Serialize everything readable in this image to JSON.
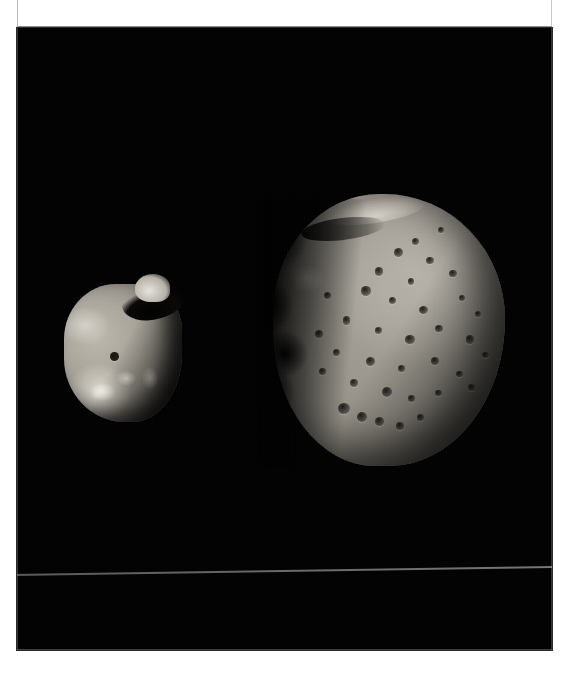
{
  "page": {
    "background_color": "#ffffff",
    "kind": "scanned-photo-page"
  },
  "header": {
    "clipped_caption": "PHOBOS AND DEIMOS, THE TWO MOONS OF MARS",
    "band_color": "#ffffff",
    "border_color": "#8d8d8d"
  },
  "plate": {
    "name": "photographic-plate",
    "background_color": "#010101",
    "x": 17,
    "y": 28,
    "width": 535,
    "height": 622,
    "artifact": {
      "name": "scanner-line",
      "color": "#a8a8a8",
      "approx_y": 574
    }
  },
  "objects": [
    {
      "id": "deimos",
      "label": "Deimos",
      "role": "small-moon-left",
      "x": 47,
      "y": 256,
      "width": 118,
      "height": 138,
      "surface_color": "#b9b5ab",
      "shadow_color": "#211f1c",
      "features": [
        "concave-notch-top",
        "bright-knob",
        "single-dark-crater",
        "bright-patches-lower-left"
      ]
    },
    {
      "id": "phobos",
      "label": "Phobos",
      "role": "large-moon-right",
      "x": 256,
      "y": 166,
      "width": 232,
      "height": 272,
      "surface_color": "#a9a59c",
      "shadow_color": "#151413",
      "features": [
        "heavily-cratered",
        "ragged-terminator-left",
        "bright-top-rim",
        "crater-cluster-bottom"
      ]
    }
  ],
  "craters": [
    {
      "left": 52,
      "top": 20,
      "w": 4.0,
      "h": 3.2
    },
    {
      "left": 60,
      "top": 16,
      "w": 3.0,
      "h": 2.6
    },
    {
      "left": 66,
      "top": 23,
      "w": 3.4,
      "h": 2.8
    },
    {
      "left": 71,
      "top": 12,
      "w": 2.6,
      "h": 2.2
    },
    {
      "left": 44,
      "top": 27,
      "w": 3.6,
      "h": 3.0
    },
    {
      "left": 58,
      "top": 31,
      "w": 2.8,
      "h": 2.4
    },
    {
      "left": 76,
      "top": 28,
      "w": 3.2,
      "h": 2.6
    },
    {
      "left": 38,
      "top": 34,
      "w": 4.2,
      "h": 3.4
    },
    {
      "left": 50,
      "top": 38,
      "w": 3.0,
      "h": 2.6
    },
    {
      "left": 63,
      "top": 41,
      "w": 3.8,
      "h": 3.0
    },
    {
      "left": 80,
      "top": 37,
      "w": 2.8,
      "h": 2.4
    },
    {
      "left": 30,
      "top": 45,
      "w": 3.4,
      "h": 3.0
    },
    {
      "left": 44,
      "top": 49,
      "w": 3.0,
      "h": 2.4
    },
    {
      "left": 57,
      "top": 52,
      "w": 4.0,
      "h": 3.2
    },
    {
      "left": 70,
      "top": 48,
      "w": 3.2,
      "h": 2.6
    },
    {
      "left": 83,
      "top": 52,
      "w": 3.6,
      "h": 3.0
    },
    {
      "left": 26,
      "top": 57,
      "w": 3.0,
      "h": 2.6
    },
    {
      "left": 40,
      "top": 60,
      "w": 3.8,
      "h": 3.2
    },
    {
      "left": 54,
      "top": 63,
      "w": 3.0,
      "h": 2.4
    },
    {
      "left": 68,
      "top": 60,
      "w": 3.4,
      "h": 2.8
    },
    {
      "left": 79,
      "top": 65,
      "w": 2.8,
      "h": 2.4
    },
    {
      "left": 33,
      "top": 68,
      "w": 3.6,
      "h": 3.0
    },
    {
      "left": 47,
      "top": 71,
      "w": 4.4,
      "h": 3.6
    },
    {
      "left": 58,
      "top": 74,
      "w": 3.2,
      "h": 2.6
    },
    {
      "left": 70,
      "top": 72,
      "w": 3.0,
      "h": 2.4
    },
    {
      "left": 28,
      "top": 77,
      "w": 5.0,
      "h": 4.0
    },
    {
      "left": 36,
      "top": 80,
      "w": 4.6,
      "h": 3.8
    },
    {
      "left": 44,
      "top": 82,
      "w": 4.0,
      "h": 3.2
    },
    {
      "left": 53,
      "top": 84,
      "w": 3.4,
      "h": 2.8
    },
    {
      "left": 62,
      "top": 81,
      "w": 3.0,
      "h": 2.4
    },
    {
      "left": 87,
      "top": 43,
      "w": 2.6,
      "h": 2.2
    },
    {
      "left": 90,
      "top": 58,
      "w": 3.0,
      "h": 2.4
    },
    {
      "left": 84,
      "top": 70,
      "w": 3.2,
      "h": 2.6
    },
    {
      "left": 22,
      "top": 36,
      "w": 3.0,
      "h": 2.6
    },
    {
      "left": 18,
      "top": 50,
      "w": 3.4,
      "h": 2.8
    },
    {
      "left": 20,
      "top": 64,
      "w": 2.8,
      "h": 2.4
    }
  ]
}
